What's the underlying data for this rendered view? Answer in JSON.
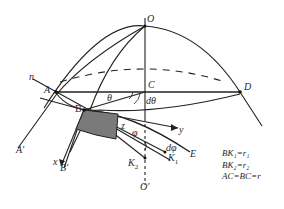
{
  "diagram": {
    "points": {
      "O": "O",
      "O_prime": "O'",
      "C": "C",
      "D": "D",
      "A": "A",
      "A_prime": "A'",
      "B": "B",
      "B_prime": "B'",
      "E": "E",
      "K1": "K",
      "K1_sub": "1",
      "K2": "K",
      "K2_sub": "2",
      "n": "n",
      "x": "x",
      "y": "y",
      "z": "z"
    },
    "angles": {
      "theta": "θ",
      "dtheta": "dθ",
      "phi": "φ",
      "dphi": "dφ"
    },
    "legend": [
      "BK₁=r₁",
      "BK₂=r₂",
      "AC=BC=r"
    ],
    "colors": {
      "line": "#222222",
      "shaded_element": "#7a7a7a"
    }
  }
}
